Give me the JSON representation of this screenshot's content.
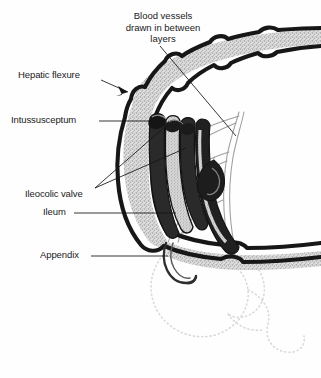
{
  "figure": {
    "type": "anatomical-diagram",
    "background_color": "#fefefe",
    "ink_color": "#1a1a1a",
    "stipple_color": "#d4d4d4",
    "vessel_color": "#9a9a9a",
    "ghost_color": "#d8d8d8"
  },
  "labels": {
    "blood_vessels": {
      "line1": "Blood vessels",
      "line2": "drawn in between",
      "line3": "layers"
    },
    "hepatic_flexure": "Hepatic flexure",
    "intussusceptum": "Intussusceptum",
    "ileocolic_valve": "Ileocolic valve",
    "ileum": "Ileum",
    "appendix": "Appendix"
  }
}
